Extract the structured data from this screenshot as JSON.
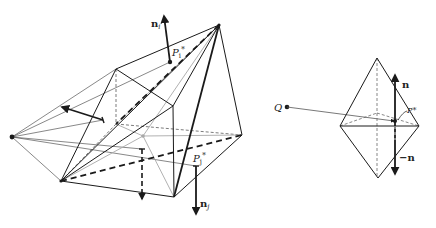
{
  "figure": {
    "left": {
      "labels": {
        "n_i": {
          "main": "n",
          "sub": "i"
        },
        "p_i": {
          "main": "P",
          "sub": "i",
          "sup": "*"
        },
        "p_j": {
          "main": "P",
          "sub": "j",
          "sup": "*"
        },
        "n_j": {
          "main": "n",
          "sub": "j"
        }
      }
    },
    "right": {
      "labels": {
        "q": "Q",
        "n": "n",
        "neg_n": "−n",
        "p_star": "P*"
      }
    }
  },
  "colors": {
    "ink": "#1a1a1a",
    "gray_line": "#a8a8a8",
    "light_line": "#8a8a8a"
  }
}
